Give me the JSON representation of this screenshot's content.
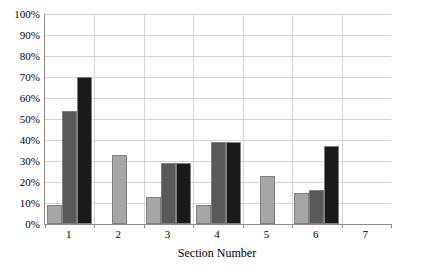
{
  "chart_data": {
    "type": "bar",
    "title": "",
    "subtitle": "",
    "xlabel": "Section Number",
    "ylabel": "",
    "categories": [
      "1",
      "2",
      "3",
      "4",
      "5",
      "6",
      "7"
    ],
    "ylim": [
      0,
      100
    ],
    "yticks": [
      0,
      10,
      20,
      30,
      40,
      50,
      60,
      70,
      80,
      90,
      100
    ],
    "ytick_labels": [
      "0%",
      "10%",
      "20%",
      "30%",
      "40%",
      "50%",
      "60%",
      "70%",
      "80%",
      "90%",
      "100%"
    ],
    "grid": "horizontal-and-vertical",
    "legend": "none",
    "value_unit": "%",
    "series": [
      {
        "name": "series-1",
        "color": "#a6a6a6",
        "values": [
          9,
          33,
          13,
          9,
          23,
          15,
          null
        ]
      },
      {
        "name": "series-2",
        "color": "#595959",
        "values": [
          54,
          null,
          29,
          39,
          null,
          16,
          null
        ]
      },
      {
        "name": "series-3",
        "color": "#1a1a1a",
        "values": [
          70,
          null,
          29,
          39,
          null,
          37,
          null
        ]
      }
    ]
  },
  "axis": {
    "y_tick_labels": [
      "100%",
      "90%",
      "80%",
      "70%",
      "60%",
      "50%",
      "40%",
      "30%",
      "20%",
      "10%",
      "0%"
    ],
    "x_tick_labels": [
      "1",
      "2",
      "3",
      "4",
      "5",
      "6",
      "7"
    ],
    "x_title": "Section Number"
  },
  "colors": {
    "series_1": "#a6a6a6",
    "series_2": "#595959",
    "series_3": "#1a1a1a",
    "gridline": "#d4d4d4",
    "axis_line": "#8a8a8a",
    "background": "#ffffff",
    "bar_outline": "#7f7f7f"
  }
}
